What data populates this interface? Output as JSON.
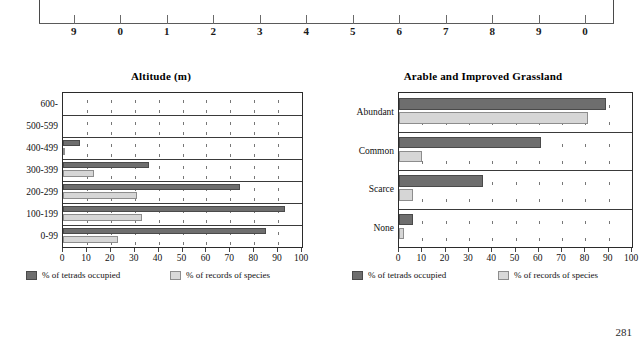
{
  "page": {
    "number": "281"
  },
  "top_axis": {
    "tick_labels": [
      "9",
      "0",
      "1",
      "2",
      "3",
      "4",
      "5",
      "6",
      "7",
      "8",
      "9",
      "0"
    ]
  },
  "legend": {
    "series_dark_label": "% of tetrads occupied",
    "series_light_label": "% of records of species",
    "color_dark": "#6e6e6e",
    "color_light": "#d6d6d6"
  },
  "charts": [
    {
      "id": "altitude",
      "title": "Altitude (m)"
    },
    {
      "id": "arable-and-improved-grassland",
      "title": "Arable and Improved Grassland"
    }
  ],
  "chart_data": [
    {
      "type": "bar",
      "orientation": "horizontal",
      "title": "Altitude (m)",
      "xlabel": "",
      "ylabel": "",
      "xlim": [
        0,
        100
      ],
      "xticks": [
        0,
        10,
        20,
        30,
        40,
        50,
        60,
        70,
        80,
        90,
        100
      ],
      "grid": true,
      "legend_position": "below",
      "categories": [
        "600-",
        "500-599",
        "400-499",
        "300-399",
        "200-299",
        "100-199",
        "0-99"
      ],
      "series": [
        {
          "name": "% of tetrads occupied",
          "color": "#6e6e6e",
          "values": [
            0,
            0,
            7,
            36,
            74,
            93,
            85
          ]
        },
        {
          "name": "% of records of species",
          "color": "#d6d6d6",
          "values": [
            0,
            0,
            1,
            13,
            31,
            33,
            23
          ]
        }
      ]
    },
    {
      "type": "bar",
      "orientation": "horizontal",
      "title": "Arable and Improved Grassland",
      "xlabel": "",
      "ylabel": "",
      "xlim": [
        0,
        100
      ],
      "xticks": [
        0,
        10,
        20,
        30,
        40,
        50,
        60,
        70,
        80,
        90,
        100
      ],
      "grid": true,
      "legend_position": "below",
      "categories": [
        "Abundant",
        "Common",
        "Scarce",
        "None"
      ],
      "series": [
        {
          "name": "% of tetrads occupied",
          "color": "#6e6e6e",
          "values": [
            89,
            61,
            36,
            6
          ]
        },
        {
          "name": "% of records of species",
          "color": "#d6d6d6",
          "values": [
            81,
            10,
            6,
            2
          ]
        }
      ]
    }
  ]
}
